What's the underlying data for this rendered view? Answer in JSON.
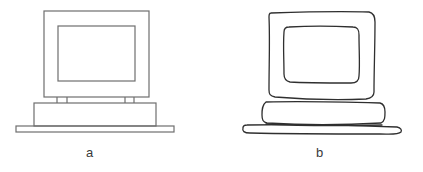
{
  "figure": {
    "panels": [
      {
        "id": "a",
        "label": "a",
        "style": "precise",
        "subject": "computer monitor on base unit"
      },
      {
        "id": "b",
        "label": "b",
        "style": "sketched",
        "subject": "computer monitor on base unit"
      }
    ],
    "colors": {
      "stroke_precise": "#6e6e6e",
      "stroke_sketch": "#2f2f2f",
      "background": "#ffffff"
    }
  }
}
